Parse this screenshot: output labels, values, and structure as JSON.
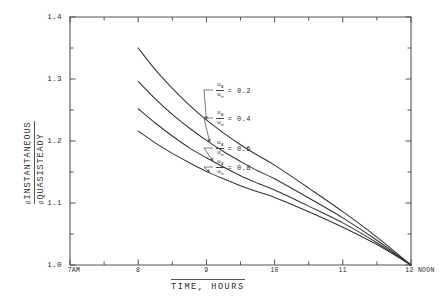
{
  "figure": {
    "background_color": "#ffffff",
    "ink_color": "#2a2a2a",
    "axis_color": "#555555",
    "curve_color": "#333333"
  },
  "axes": {
    "y_title_numerator": "INSTANTANEOUS",
    "y_title_denominator": "QUASISTEADY",
    "y_title_symbol": "β",
    "x_title": "TIME, HOURS",
    "y_tick_labels": [
      "1.0",
      "1.1",
      "1.2",
      "1.3",
      "1.4"
    ],
    "y_tick_values": [
      1.0,
      1.1,
      1.2,
      1.3,
      1.4
    ],
    "y_minor_tick_values": [
      1.05,
      1.15,
      1.25,
      1.35
    ],
    "x_tick_labels": [
      "7AM",
      "8",
      "9",
      "10",
      "11",
      "12 NOON"
    ],
    "x_tick_values": [
      7,
      8,
      9,
      10,
      11,
      12
    ],
    "x_minor_tick_values": [
      7.5,
      8.5,
      9.5,
      10.5,
      11.5
    ]
  },
  "curve_labels": [
    {
      "id": "c02",
      "numerator": "u",
      "numerator_sub": "a",
      "denominator": "u",
      "denominator_sub": "∞",
      "equals": "= 0.2"
    },
    {
      "id": "c04",
      "numerator": "u",
      "numerator_sub": "a",
      "denominator": "u",
      "denominator_sub": "∞",
      "equals": "= 0.4"
    },
    {
      "id": "c06",
      "numerator": "u",
      "numerator_sub": "a",
      "denominator": "u",
      "denominator_sub": "∞",
      "equals": "= 0.6"
    },
    {
      "id": "c08",
      "numerator": "u",
      "numerator_sub": "a",
      "denominator": "u",
      "denominator_sub": "∞",
      "equals": "= 0.8"
    }
  ],
  "chart_data": {
    "type": "line",
    "title": "",
    "xlabel": "TIME, HOURS",
    "ylabel": "β INSTANTANEOUS / β QUASISTEADY",
    "xlim": [
      7,
      12
    ],
    "ylim": [
      1.0,
      1.4
    ],
    "grid": false,
    "legend": "inline-annotations",
    "x_tick_labels": [
      "7AM",
      "8",
      "9",
      "10",
      "11",
      "12 NOON"
    ],
    "y_tick_labels": [
      "1.0",
      "1.1",
      "1.2",
      "1.3",
      "1.4"
    ],
    "x": [
      8.0,
      8.25,
      8.5,
      8.75,
      9.0,
      9.25,
      9.5,
      9.75,
      10.0,
      10.5,
      11.0,
      11.5,
      12.0
    ],
    "series": [
      {
        "name": "u_a/u_inf = 0.2",
        "label_value": 0.2,
        "values": [
          1.35,
          1.315,
          1.285,
          1.258,
          1.234,
          1.213,
          1.194,
          1.177,
          1.161,
          1.124,
          1.086,
          1.045,
          1.0
        ]
      },
      {
        "name": "u_a/u_inf = 0.4",
        "label_value": 0.4,
        "values": [
          1.296,
          1.268,
          1.243,
          1.221,
          1.201,
          1.183,
          1.167,
          1.152,
          1.139,
          1.108,
          1.076,
          1.04,
          1.0
        ]
      },
      {
        "name": "u_a/u_inf = 0.6",
        "label_value": 0.6,
        "values": [
          1.252,
          1.229,
          1.208,
          1.189,
          1.173,
          1.158,
          1.144,
          1.132,
          1.121,
          1.095,
          1.068,
          1.036,
          1.0
        ]
      },
      {
        "name": "u_a/u_inf = 0.8",
        "label_value": 0.8,
        "values": [
          1.216,
          1.197,
          1.18,
          1.165,
          1.151,
          1.139,
          1.128,
          1.118,
          1.109,
          1.086,
          1.061,
          1.033,
          1.0
        ]
      }
    ]
  }
}
